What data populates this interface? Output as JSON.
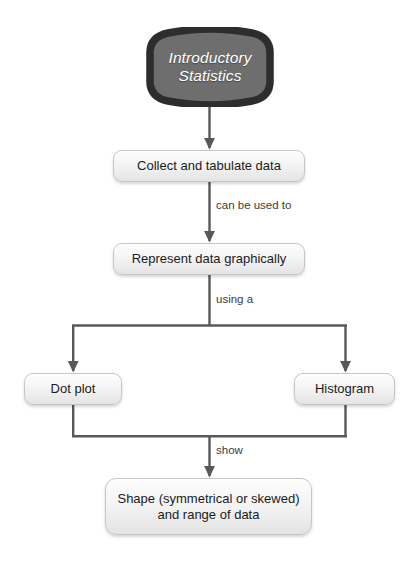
{
  "diagram": {
    "title": "Introductory Statistics",
    "type": "flowchart",
    "orientation": "top-down"
  },
  "start_node": {
    "line1": "Introductory",
    "line2": "Statistics",
    "fill_color": "#6e6e6e",
    "border_color": "#2d2d2d",
    "text_color": "#ffffff"
  },
  "nodes": {
    "collect": {
      "label": "Collect and tabulate data"
    },
    "represent": {
      "label": "Represent data graphically"
    },
    "dotplot": {
      "label": "Dot plot"
    },
    "histogram": {
      "label": "Histogram"
    },
    "shape": {
      "line1": "Shape (symmetrical or skewed)",
      "line2": "and range of data"
    }
  },
  "edge_labels": {
    "can_be_used_to": "can be used to",
    "using_a": "using a",
    "show": "show"
  },
  "colors": {
    "connector": "#58585a",
    "box_border": "#c6c6c6",
    "box_fill_top": "#fdfdfd",
    "box_fill_bottom": "#e4e4e4",
    "label_text": "#3c3c3c",
    "body_text": "#1b1b1b",
    "background": "#ffffff"
  }
}
